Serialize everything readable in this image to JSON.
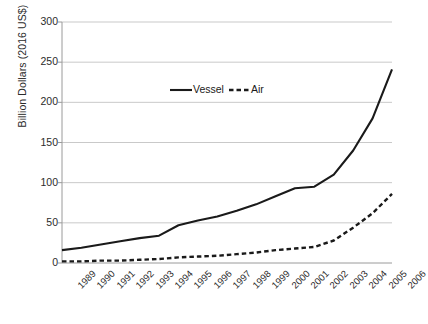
{
  "chart_data": {
    "type": "line",
    "title": "",
    "xlabel": "",
    "ylabel": "Billion Dollars (2016 US$)",
    "ylim": [
      0,
      300
    ],
    "ytick_labels": [
      "0",
      "50",
      "100",
      "150",
      "200",
      "250",
      "300"
    ],
    "ytick_values": [
      0,
      50,
      100,
      150,
      200,
      250,
      300
    ],
    "grid": "horizontal",
    "legend_position": "upper-center",
    "categories": [
      "1989",
      "1990",
      "1991",
      "1992",
      "1993",
      "1994",
      "1995",
      "1996",
      "1997",
      "1998",
      "1999",
      "2000",
      "2001",
      "2002",
      "2003",
      "2004",
      "2005",
      "2006"
    ],
    "series": [
      {
        "name": "Vessel",
        "style": "solid",
        "color": "#1a1a1a",
        "values": [
          16,
          19,
          23,
          27,
          31,
          34,
          47,
          53,
          58,
          65,
          73,
          83,
          93,
          95,
          110,
          140,
          180,
          241
        ]
      },
      {
        "name": "Air",
        "style": "dashed",
        "color": "#1a1a1a",
        "values": [
          2,
          2,
          3,
          3,
          4,
          5,
          7,
          8,
          9,
          11,
          13,
          16,
          18,
          20,
          28,
          44,
          62,
          86
        ]
      }
    ]
  },
  "legend": {
    "vessel_label": "Vessel",
    "air_label": "Air"
  },
  "axis": {
    "y_title": "Billion Dollars (2016 US$)"
  }
}
